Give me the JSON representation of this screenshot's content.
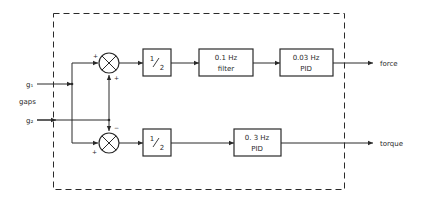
{
  "diagram": {
    "type": "block-diagram",
    "inputs": {
      "group_label": "gaps",
      "g1": "g₁",
      "g2": "g₂"
    },
    "summers": {
      "top": {
        "sign_left": "+",
        "sign_bottom": "+"
      },
      "bottom": {
        "sign_left": "+",
        "sign_top": "−"
      }
    },
    "blocks": {
      "top_half": {
        "num": "1",
        "den": "2"
      },
      "filter": {
        "line1": "0.1  Hz",
        "line2": "filter"
      },
      "pid_force": {
        "line1": "0.03 Hz",
        "line2": "PID"
      },
      "bottom_half": {
        "num": "1",
        "den": "2"
      },
      "pid_torque": {
        "line1": "0. 3 Hz",
        "line2": "PID"
      }
    },
    "outputs": {
      "force": "force",
      "torque": "torque"
    },
    "colors": {
      "ink": "#2a2a2a",
      "background": "#ffffff"
    }
  }
}
